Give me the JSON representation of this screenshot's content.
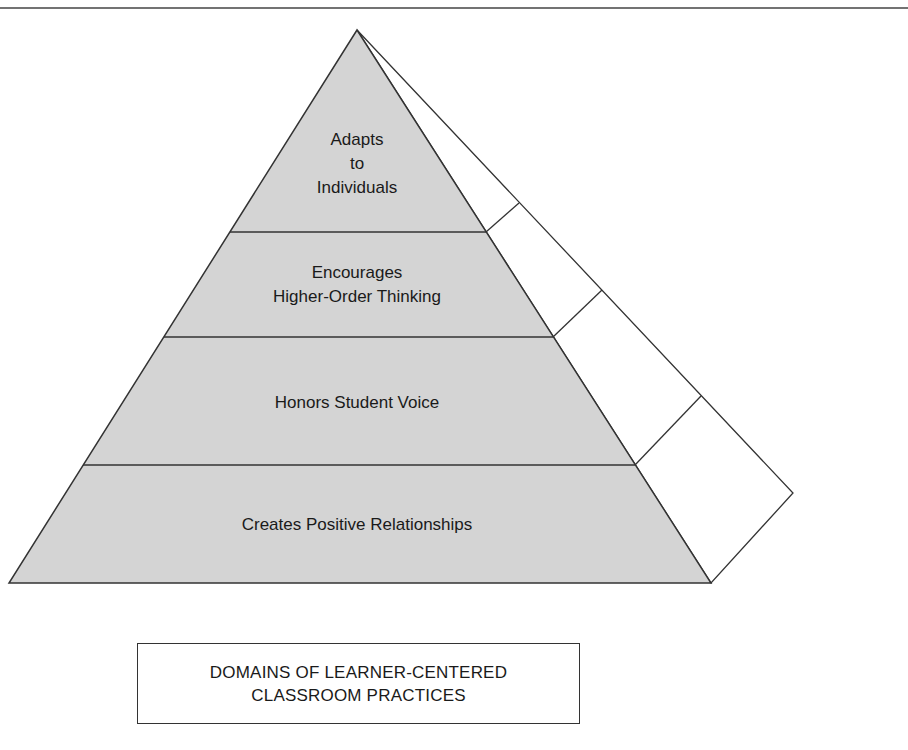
{
  "diagram": {
    "colors": {
      "face_fill": "#d4d4d4",
      "side_fill": "#ffffff",
      "stroke": "#333333",
      "text": "#1a1a1a"
    },
    "levels": [
      {
        "id": "top",
        "lines": [
          "Adapts",
          "to",
          "Individuals"
        ]
      },
      {
        "id": "second",
        "lines": [
          "Encourages",
          "Higher-Order Thinking"
        ]
      },
      {
        "id": "third",
        "lines": [
          "Honors Student Voice"
        ]
      },
      {
        "id": "base",
        "lines": [
          "Creates Positive Relationships"
        ]
      }
    ],
    "caption": {
      "lines": [
        "DOMAINS OF LEARNER-CENTERED",
        "CLASSROOM PRACTICES"
      ]
    }
  }
}
